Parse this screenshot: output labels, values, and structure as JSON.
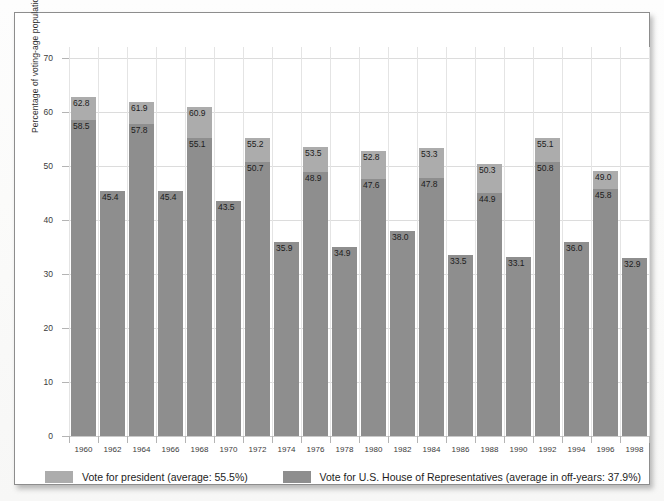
{
  "chart_data": {
    "type": "bar",
    "title": "",
    "xlabel": "",
    "ylabel": "Percentage of voting-age population participating",
    "ylim": [
      0,
      72
    ],
    "yticks": [
      0,
      10,
      20,
      30,
      40,
      50,
      60,
      70
    ],
    "grid": true,
    "legend_position": "bottom",
    "categories": [
      "1960",
      "1962",
      "1964",
      "1966",
      "1968",
      "1970",
      "1972",
      "1974",
      "1976",
      "1978",
      "1980",
      "1982",
      "1984",
      "1986",
      "1988",
      "1990",
      "1992",
      "1994",
      "1996",
      "1998"
    ],
    "series": [
      {
        "name": "Vote for president",
        "color": "#acacac",
        "values": [
          62.8,
          null,
          61.9,
          null,
          60.9,
          null,
          55.2,
          null,
          53.5,
          null,
          52.8,
          null,
          53.3,
          null,
          50.3,
          null,
          55.1,
          null,
          49.0,
          null
        ]
      },
      {
        "name": "Vote for U.S. House of Representatives",
        "color": "#8e8e8e",
        "values": [
          58.5,
          45.4,
          57.8,
          45.4,
          55.1,
          43.5,
          50.7,
          35.9,
          48.9,
          34.9,
          47.6,
          38.0,
          47.8,
          33.5,
          44.9,
          33.1,
          50.8,
          36.0,
          45.8,
          32.9
        ]
      }
    ],
    "bars": [
      {
        "year": "1960",
        "president": "62.8",
        "house": "58.5"
      },
      {
        "year": "1962",
        "president": null,
        "house": "45.4"
      },
      {
        "year": "1964",
        "president": "61.9",
        "house": "57.8"
      },
      {
        "year": "1966",
        "president": null,
        "house": "45.4"
      },
      {
        "year": "1968",
        "president": "60.9",
        "house": "55.1"
      },
      {
        "year": "1970",
        "president": null,
        "house": "43.5"
      },
      {
        "year": "1972",
        "president": "55.2",
        "house": "50.7"
      },
      {
        "year": "1974",
        "president": null,
        "house": "35.9"
      },
      {
        "year": "1976",
        "president": "53.5",
        "house": "48.9"
      },
      {
        "year": "1978",
        "president": null,
        "house": "34.9"
      },
      {
        "year": "1980",
        "president": "52.8",
        "house": "47.6"
      },
      {
        "year": "1982",
        "president": null,
        "house": "38.0"
      },
      {
        "year": "1984",
        "president": "53.3",
        "house": "47.8"
      },
      {
        "year": "1986",
        "president": null,
        "house": "33.5"
      },
      {
        "year": "1988",
        "president": "50.3",
        "house": "44.9"
      },
      {
        "year": "1990",
        "president": null,
        "house": "33.1"
      },
      {
        "year": "1992",
        "president": "55.1",
        "house": "50.8"
      },
      {
        "year": "1994",
        "president": null,
        "house": "36.0"
      },
      {
        "year": "1996",
        "president": "49.0",
        "house": "45.8"
      },
      {
        "year": "1998",
        "president": null,
        "house": "32.9"
      }
    ],
    "legend": [
      {
        "label": "Vote for president (average: 55.5%)",
        "color": "#acacac",
        "swatch": "pres"
      },
      {
        "label": "Vote for U.S. House of Representatives (average in off-years: 37.9%)",
        "color": "#8e8e8e",
        "swatch": "house"
      }
    ]
  }
}
